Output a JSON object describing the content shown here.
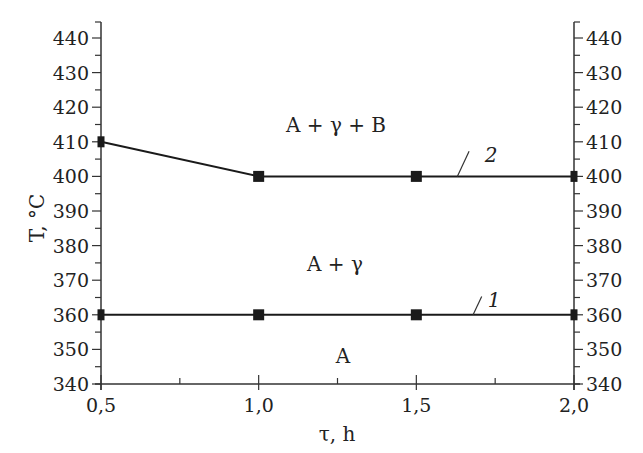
{
  "chart_data": {
    "type": "line",
    "title": "",
    "xlabel": "τ, h",
    "ylabel": "T, °C",
    "xlim": [
      0.5,
      2.0
    ],
    "ylim": [
      340,
      445
    ],
    "x_ticks": [
      0.5,
      1.0,
      1.5,
      2.0
    ],
    "x_tick_labels": [
      "0,5",
      "1,0",
      "1,5",
      "2,0"
    ],
    "x_minor_step": 0.25,
    "y_ticks": [
      340,
      350,
      360,
      370,
      380,
      390,
      400,
      410,
      420,
      430,
      440
    ],
    "y_tick_labels": [
      "340",
      "350",
      "360",
      "370",
      "380",
      "390",
      "400",
      "410",
      "420",
      "430",
      "440"
    ],
    "y_minor_step": 5,
    "right_axis_mirrored": true,
    "grid": false,
    "series": [
      {
        "name": "1",
        "marker": "square",
        "color": "#1a1a1a",
        "x": [
          0.5,
          1.0,
          1.5,
          2.0
        ],
        "y": [
          360,
          360,
          360,
          360
        ]
      },
      {
        "name": "2",
        "marker": "square",
        "color": "#1a1a1a",
        "x": [
          0.5,
          1.0,
          1.5,
          2.0
        ],
        "y": [
          410,
          400,
          400,
          400
        ]
      }
    ],
    "annotations": [
      {
        "text": "A + γ + B",
        "x": 1.0,
        "y": 418,
        "kind": "region"
      },
      {
        "text": "A + γ",
        "x": 0.86,
        "y": 370,
        "kind": "region"
      },
      {
        "text": "A",
        "x": 0.93,
        "y": 349,
        "kind": "region"
      },
      {
        "text": "1",
        "kind": "curve-label",
        "series": "1",
        "label_x": 1.72,
        "label_y": 367,
        "anchor_x": 1.68,
        "anchor_y": 360
      },
      {
        "text": "2",
        "kind": "curve-label",
        "series": "2",
        "label_x": 1.68,
        "label_y": 409,
        "anchor_x": 1.63,
        "anchor_y": 400
      }
    ]
  },
  "labels": {
    "xlabel": "τ, h",
    "ylabel": "T, °C",
    "region_aggb": "A + γ + B",
    "region_ag": "A + γ",
    "region_a": "A",
    "curve1": "1",
    "curve2": "2"
  }
}
